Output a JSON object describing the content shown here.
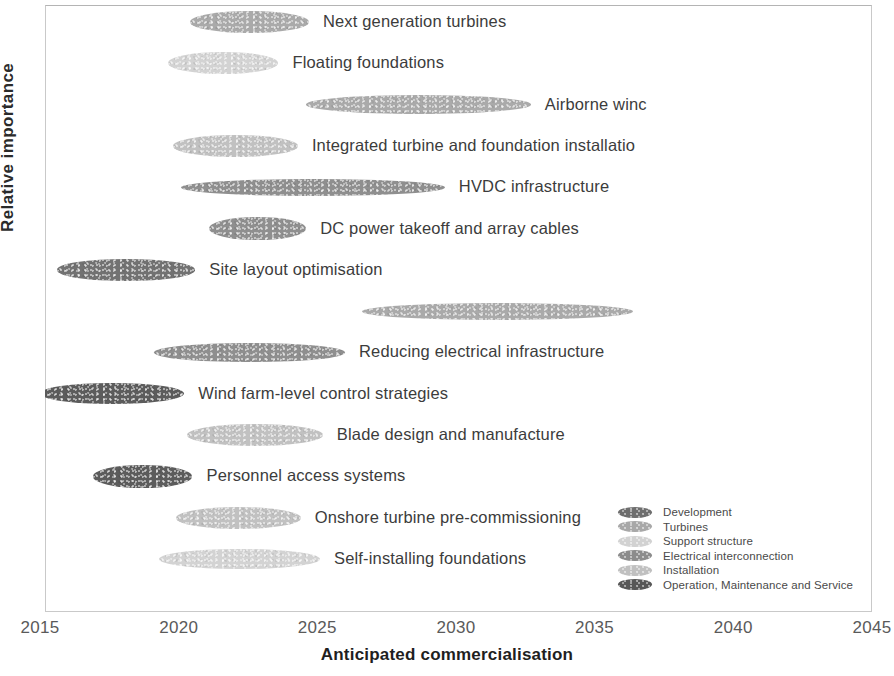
{
  "chart_data": {
    "type": "scatter",
    "title": "",
    "xlabel": "Anticipated commercialisation",
    "ylabel": "Relative importance",
    "xlim": [
      2015,
      2045
    ],
    "ylim": [
      0,
      14
    ],
    "grid": false,
    "x_ticks": [
      "2015",
      "2020",
      "2025",
      "2030",
      "2035",
      "2040",
      "2045"
    ],
    "y_ticks": [],
    "legend_position": "inside bottom-right",
    "marker_shape": "horizontal-ellipse",
    "note": "Technology roadmap: each ellipse spans the anticipated commercialisation window; vertical position indicates relative importance (higher = more important). Two labels are clipped by the right plot border in the source scan.",
    "categories": [
      {
        "key": "development",
        "label": "Development",
        "color": "#6e6e6e"
      },
      {
        "key": "turbines",
        "label": "Turbines",
        "color": "#a8a8a8"
      },
      {
        "key": "support_structure",
        "label": "Support structure",
        "color": "#d2d2d2"
      },
      {
        "key": "electrical_interconnection",
        "label": "Electrical interconnection",
        "color": "#8c8c8c"
      },
      {
        "key": "installation",
        "label": "Installation",
        "color": "#c0c0c0"
      },
      {
        "key": "operation_maintenance_service",
        "label": "Operation, Maintenance and Service",
        "color": "#575757"
      }
    ],
    "points": [
      {
        "label": "Next generation turbines",
        "category": "turbines",
        "x_start": 2020.4,
        "x_end": 2024.7,
        "x_center": 2022.55,
        "importance_rank": 14,
        "label_side": "right"
      },
      {
        "label": "Floating foundations",
        "category": "support_structure",
        "x_start": 2019.6,
        "x_end": 2023.6,
        "x_center": 2021.6,
        "importance_rank": 13,
        "label_side": "right"
      },
      {
        "label": "Airborne winc",
        "category": "turbines",
        "x_start": 2024.6,
        "x_end": 2032.7,
        "x_center": 2028.65,
        "importance_rank": 12,
        "label_side": "right",
        "clipped": true
      },
      {
        "label": "Integrated turbine and foundation installatio",
        "category": "installation",
        "x_start": 2019.8,
        "x_end": 2024.3,
        "x_center": 2022.05,
        "importance_rank": 11,
        "label_side": "right",
        "clipped": true
      },
      {
        "label": "HVDC infrastructure",
        "category": "electrical_interconnection",
        "x_start": 2020.1,
        "x_end": 2029.6,
        "x_center": 2024.85,
        "importance_rank": 10,
        "label_side": "right"
      },
      {
        "label": "DC power takeoff and array cables",
        "category": "electrical_interconnection",
        "x_start": 2021.1,
        "x_end": 2024.6,
        "x_center": 2022.85,
        "importance_rank": 9,
        "label_side": "right"
      },
      {
        "label": "Site layout optimisation",
        "category": "development",
        "x_start": 2015.6,
        "x_end": 2020.6,
        "x_center": 2018.1,
        "importance_rank": 8,
        "label_side": "right"
      },
      {
        "label": "Increased turbine rating",
        "category": "turbines",
        "x_start": 2026.6,
        "x_end": 2036.4,
        "x_center": 2031.5,
        "importance_rank": 7,
        "label_side": "left"
      },
      {
        "label": "Reducing electrical infrastructure",
        "category": "electrical_interconnection",
        "x_start": 2019.1,
        "x_end": 2026.0,
        "x_center": 2022.55,
        "importance_rank": 6,
        "label_side": "right"
      },
      {
        "label": "Wind farm-level control strategies",
        "category": "operation_maintenance_service",
        "x_start": 2015.0,
        "x_end": 2020.2,
        "x_center": 2017.6,
        "importance_rank": 5,
        "label_side": "right"
      },
      {
        "label": "Blade design and manufacture",
        "category": "installation",
        "x_start": 2020.3,
        "x_end": 2025.2,
        "x_center": 2022.75,
        "importance_rank": 4,
        "label_side": "right"
      },
      {
        "label": "Personnel access systems",
        "category": "operation_maintenance_service",
        "x_start": 2016.9,
        "x_end": 2020.5,
        "x_center": 2018.7,
        "importance_rank": 3,
        "label_side": "right"
      },
      {
        "label": "Onshore turbine pre-commissioning",
        "category": "installation",
        "x_start": 2019.9,
        "x_end": 2024.4,
        "x_center": 2022.15,
        "importance_rank": 2,
        "label_side": "right"
      },
      {
        "label": "Self-installing foundations",
        "category": "support_structure",
        "x_start": 2019.3,
        "x_end": 2025.1,
        "x_center": 2022.2,
        "importance_rank": 1,
        "label_side": "right"
      }
    ]
  },
  "axes": {
    "x_title": "Anticipated commercialisation",
    "y_title": "Relative importance"
  }
}
